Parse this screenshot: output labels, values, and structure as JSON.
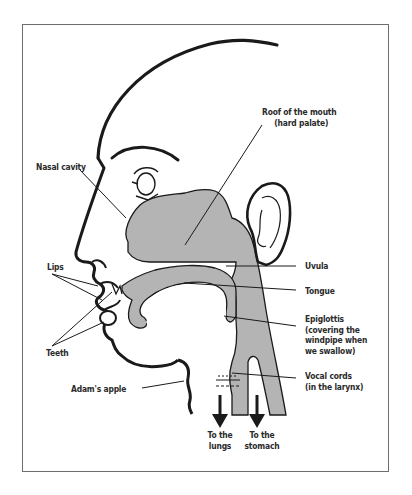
{
  "diagram": {
    "fill_color": "#b4b4b4",
    "stroke_color": "#1a1a1a",
    "labels": {
      "roof_line1": "Roof of the mouth",
      "roof_line2": "(hard palate)",
      "nasal": "Nasal cavity",
      "lips": "Lips",
      "teeth": "Teeth",
      "uvula": "Uvula",
      "tongue": "Tongue",
      "epi_line1": "Epiglottis",
      "epi_line2": "(covering the",
      "epi_line3": "windpipe when",
      "epi_line4": "we swallow)",
      "adam": "Adam's apple",
      "vocal_line1": "Vocal cords",
      "vocal_line2": "(in the larynx)",
      "lungs_line1": "To the",
      "lungs_line2": "lungs",
      "stomach_line1": "To the",
      "stomach_line2": "stomach"
    }
  }
}
